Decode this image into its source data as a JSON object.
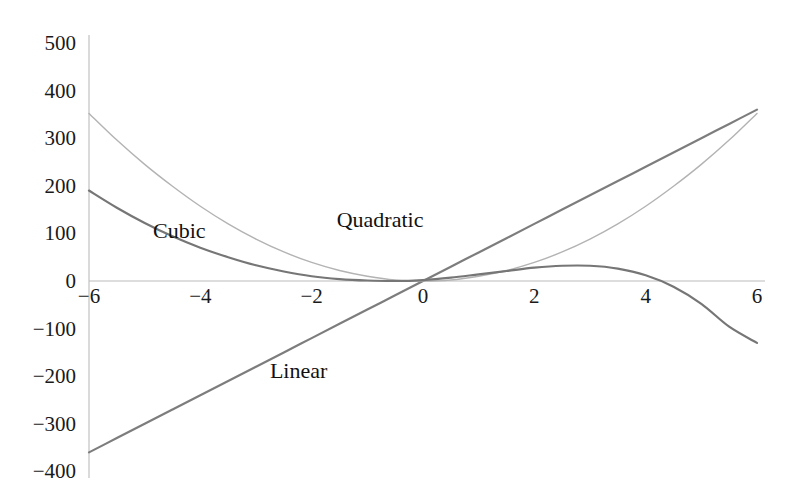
{
  "chart_data": {
    "type": "line",
    "title": "",
    "subtitle": "",
    "xlabel": "",
    "ylabel": "",
    "xlim": [
      -6,
      6
    ],
    "ylim": [
      -400,
      500
    ],
    "grid": false,
    "legend": "inline-annotations",
    "x_ticks": [
      -6,
      -4,
      -2,
      0,
      2,
      4,
      6
    ],
    "x_tick_labels": [
      "−6",
      "−4",
      "−2",
      "0",
      "2",
      "4",
      "6"
    ],
    "y_ticks": [
      500,
      400,
      300,
      200,
      100,
      0,
      -100,
      -200,
      -300,
      -400
    ],
    "y_tick_labels": [
      "500",
      "400",
      "300",
      "200",
      "100",
      "0",
      "−100",
      "−200",
      "−300",
      "−400"
    ],
    "axis_color": "#b9b9b9",
    "x": [
      -6,
      -5.5,
      -5,
      -4.5,
      -4,
      -3.5,
      -3,
      -2.5,
      -2,
      -1.5,
      -1,
      -0.5,
      0,
      0.5,
      1,
      1.5,
      2,
      2.5,
      3,
      3.5,
      4,
      4.5,
      5,
      5.5,
      6
    ],
    "series": [
      {
        "name": "Linear",
        "label": "Linear",
        "color": "#7d7d7d",
        "width": 2.2,
        "equation": "y = 60x",
        "values": [
          -360,
          -330,
          -300,
          -270,
          -240,
          -210,
          -180,
          -150,
          -120,
          -90,
          -60,
          -30,
          0,
          30,
          60,
          90,
          120,
          150,
          180,
          210,
          240,
          270,
          300,
          330,
          360
        ],
        "label_x": -2.75,
        "label_y": -190
      },
      {
        "name": "Quadratic",
        "label": "Quadratic",
        "color": "#b3b3b3",
        "width": 1.4,
        "equation": "y = 10x²",
        "values": [
          352,
          296,
          245,
          199,
          157,
          120,
          88,
          61,
          39,
          22,
          10,
          2,
          0,
          2,
          10,
          22,
          39,
          61,
          88,
          120,
          157,
          199,
          245,
          296,
          352
        ],
        "label_x": -1.55,
        "label_y": 128
      },
      {
        "name": "Cubic",
        "label": "Cubic",
        "color": "#767676",
        "width": 2.2,
        "equation": "y ≈ −x³ + 4x + 10",
        "values": [
          190,
          154,
          122,
          94,
          70,
          50,
          33,
          20,
          10,
          4,
          1,
          0,
          2,
          7,
          14,
          21,
          28,
          32,
          32,
          26,
          12,
          -12,
          -48,
          -96,
          -130
        ],
        "label_x": -4.85,
        "label_y": 105
      }
    ]
  },
  "axes": {
    "x_axis_name": "x-axis-line",
    "y_axis_name": "y-axis-line"
  }
}
